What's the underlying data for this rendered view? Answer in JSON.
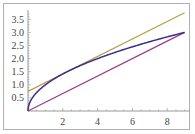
{
  "chart_data": {
    "type": "line",
    "title": "",
    "xlabel": "",
    "ylabel": "",
    "xlim": [
      0,
      9.2
    ],
    "ylim": [
      0,
      3.8
    ],
    "grid": false,
    "legend": null,
    "x_ticks": [
      "2",
      "4",
      "6",
      "8"
    ],
    "y_ticks": [
      "0.5",
      "1.0",
      "1.5",
      "2.0",
      "2.5",
      "3.0",
      "3.5"
    ],
    "series": [
      {
        "name": "sqrt(x)",
        "color": "#3a2f8f",
        "x": [
          0,
          0.25,
          1,
          2.25,
          4,
          6.25,
          9
        ],
        "y": [
          0,
          0.5,
          1,
          1.5,
          2,
          2.5,
          3
        ]
      },
      {
        "name": "tangent line",
        "color": "#b8a04a",
        "x": [
          0,
          9
        ],
        "y": [
          0.75,
          3.75
        ]
      },
      {
        "name": "secant line",
        "color": "#9c3c8c",
        "x": [
          0,
          9
        ],
        "y": [
          0,
          3
        ]
      }
    ]
  },
  "axes": {
    "x_labels": [
      "2",
      "4",
      "6",
      "8"
    ],
    "y_labels": [
      "0.5",
      "1.0",
      "1.5",
      "2.0",
      "2.5",
      "3.0",
      "3.5"
    ]
  }
}
